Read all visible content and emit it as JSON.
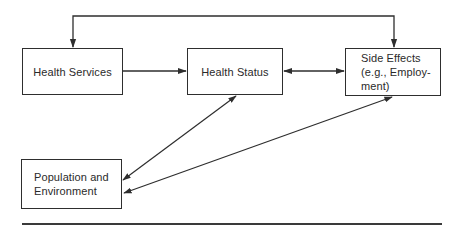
{
  "diagram": {
    "nodes": [
      {
        "id": "health-services",
        "label": "Health Services"
      },
      {
        "id": "health-status",
        "label": "Health Status"
      },
      {
        "id": "side-effects",
        "label": "Side Effects\n(e.g., Employ-\nment)"
      },
      {
        "id": "population",
        "label": "Population and\nEnvironment"
      }
    ],
    "edges": [
      {
        "from": "side-effects",
        "to": "health-services",
        "type": "one-way",
        "route": "top loop"
      },
      {
        "from": "health-services",
        "to": "health-status",
        "type": "one-way"
      },
      {
        "from": "health-status",
        "to": "side-effects",
        "type": "two-way"
      },
      {
        "from": "health-status",
        "to": "population",
        "type": "two-way"
      },
      {
        "from": "side-effects",
        "to": "population",
        "type": "two-way"
      }
    ],
    "colors": {
      "line": "#2e2e2e",
      "background": "#ffffff",
      "text": "#2a2a2a"
    }
  }
}
